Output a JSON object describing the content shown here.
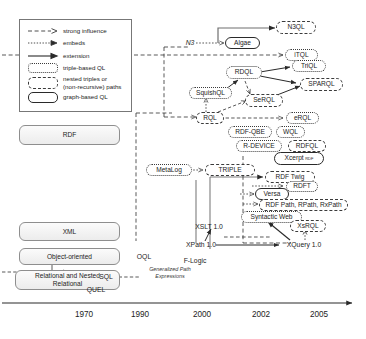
{
  "figure": {
    "type": "timeline-diagram"
  },
  "legend": {
    "items": [
      {
        "key": "strong-influence",
        "label": "strong influence",
        "style": "dashed-arrow"
      },
      {
        "key": "embeds",
        "label": "embeds",
        "style": "dotted-arrow"
      },
      {
        "key": "extension",
        "label": "extension",
        "style": "solid-arrow"
      },
      {
        "key": "triple-based",
        "label": "triple-based QL",
        "style": "dotted-pill"
      },
      {
        "key": "nested-triples",
        "label": "nested triples or\n(non-recursive) paths",
        "label_line1": "nested triples or",
        "label_line2": "(non-recursive) paths",
        "style": "dashed-pill"
      },
      {
        "key": "graph-based",
        "label": "graph-based QL",
        "style": "solid-pill"
      }
    ]
  },
  "models": [
    {
      "id": "rdf",
      "label": "RDF"
    },
    {
      "id": "xml",
      "label": "XML"
    },
    {
      "id": "oo",
      "label": "Object-oriented"
    },
    {
      "id": "relational",
      "label": "Relational and Nested Relational",
      "line1": "Relational and Nested",
      "line2": "Relational"
    }
  ],
  "nodes": [
    {
      "id": "n3",
      "label": "N3",
      "style": "plain-italic"
    },
    {
      "id": "algae",
      "label": "Algae",
      "style": "graph"
    },
    {
      "id": "n3ql",
      "label": "N3QL",
      "style": "nested"
    },
    {
      "id": "itql",
      "label": "iTQL",
      "style": "triple"
    },
    {
      "id": "rdql",
      "label": "RDQL",
      "style": "triple"
    },
    {
      "id": "triql",
      "label": "TriQL",
      "style": "triple"
    },
    {
      "id": "sparql",
      "label": "SPARQL",
      "style": "nested"
    },
    {
      "id": "squishql",
      "label": "SquishQL",
      "style": "triple"
    },
    {
      "id": "serql",
      "label": "SeRQL",
      "style": "nested"
    },
    {
      "id": "rql",
      "label": "RQL",
      "style": "nested"
    },
    {
      "id": "erql",
      "label": "eRQL",
      "style": "triple"
    },
    {
      "id": "rdfqbe",
      "label": "RDF-QBE",
      "style": "triple"
    },
    {
      "id": "wql",
      "label": "WQL",
      "style": "triple"
    },
    {
      "id": "rdevice",
      "label": "R-DEVICE",
      "style": "triple"
    },
    {
      "id": "rdfql",
      "label": "RDFQL",
      "style": "nested"
    },
    {
      "id": "xcerpt",
      "label": "Xcerpt",
      "style": "graph",
      "suffix": "RDF"
    },
    {
      "id": "metalog",
      "label": "MetaLog",
      "style": "triple"
    },
    {
      "id": "triple",
      "label": "TRIPLE",
      "style": "nested"
    },
    {
      "id": "rdftwig",
      "label": "RDF Twig",
      "style": "nested"
    },
    {
      "id": "rdft",
      "label": "RDFT",
      "style": "triple"
    },
    {
      "id": "versa",
      "label": "Versa",
      "style": "graph"
    },
    {
      "id": "rdfpath",
      "label": "RDF Path, RPath, RxPath",
      "style": "nested"
    },
    {
      "id": "syntactic",
      "label": "Syntactic Web",
      "style": "triple"
    },
    {
      "id": "xsrql",
      "label": "XsRQL",
      "style": "nested"
    },
    {
      "id": "xquery",
      "label": "XQuery 1.0",
      "style": "plain"
    },
    {
      "id": "xslt",
      "label": "XSLT 1.0",
      "style": "plain"
    },
    {
      "id": "xpath",
      "label": "XPath 1.0",
      "style": "plain"
    },
    {
      "id": "oql",
      "label": "OQL",
      "style": "plain"
    },
    {
      "id": "flogic",
      "label": "F-Logic",
      "style": "plain"
    },
    {
      "id": "sql",
      "label": "SQL",
      "style": "plain"
    },
    {
      "id": "quel",
      "label": "QUEL",
      "style": "plain"
    },
    {
      "id": "gpe",
      "label": "Generalized Path Expressions",
      "style": "tiny-italic",
      "line1": "Generalized Path",
      "line2": "Expressions"
    }
  ],
  "timeline": {
    "ticks": [
      "1970",
      "1990",
      "2000",
      "2002",
      "2005"
    ]
  },
  "colors": {
    "stroke": "#3b3b3b",
    "node_fill": "#ffffff",
    "model_border": "#8e8e8e",
    "text": "#1c1c1c"
  }
}
